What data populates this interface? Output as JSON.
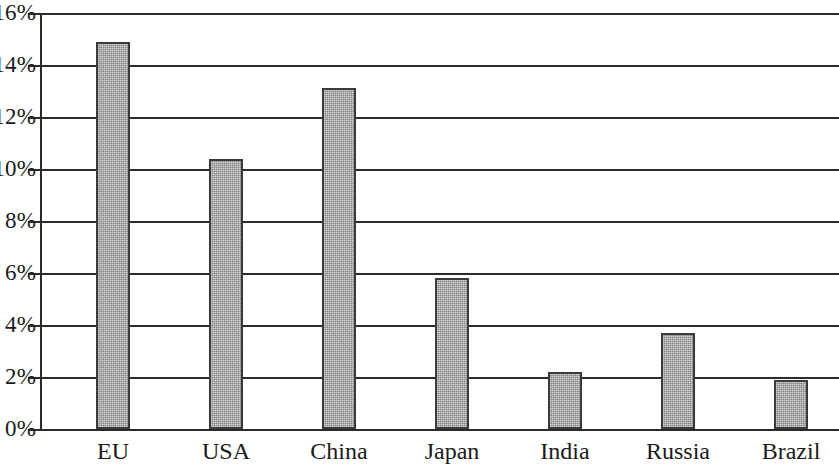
{
  "chart_data": {
    "type": "bar",
    "title": "",
    "subtitle": "",
    "xlabel": "",
    "ylabel": "",
    "categories": [
      "EU",
      "USA",
      "China",
      "Japan",
      "India",
      "Russia",
      "Brazil"
    ],
    "values": [
      14.9,
      10.4,
      13.1,
      5.8,
      2.2,
      3.7,
      1.9
    ],
    "value_unit": "%",
    "ylim": [
      0,
      16
    ],
    "ytick_labels": [
      "0%",
      "2%",
      "4%",
      "6%",
      "8%",
      "10%",
      "12%",
      "14%",
      "16%"
    ],
    "ytick_values": [
      0,
      2,
      4,
      6,
      8,
      10,
      12,
      14,
      16
    ],
    "grid": true,
    "grid_axis": "y",
    "legend": false,
    "legend_position": "none",
    "annotations": [],
    "bar_color": "#a9a9a9",
    "bar_edge_color": "#3a3a3a",
    "axis_color": "#2b2b2b",
    "background_color": "#ffffff"
  },
  "axis": {
    "ticks": [
      {
        "label": "16%",
        "value": 16
      },
      {
        "label": "14%",
        "value": 14
      },
      {
        "label": "12%",
        "value": 12
      },
      {
        "label": "10%",
        "value": 10
      },
      {
        "label": "8%",
        "value": 8
      },
      {
        "label": "6%",
        "value": 6
      },
      {
        "label": "4%",
        "value": 4
      },
      {
        "label": "2%",
        "value": 2
      },
      {
        "label": "0%",
        "value": 0
      }
    ]
  },
  "bars": [
    {
      "label": "EU",
      "value": 14.9
    },
    {
      "label": "USA",
      "value": 10.4
    },
    {
      "label": "China",
      "value": 13.1
    },
    {
      "label": "Japan",
      "value": 5.8
    },
    {
      "label": "India",
      "value": 2.2
    },
    {
      "label": "Russia",
      "value": 3.7
    },
    {
      "label": "Brazil",
      "value": 1.9
    }
  ]
}
